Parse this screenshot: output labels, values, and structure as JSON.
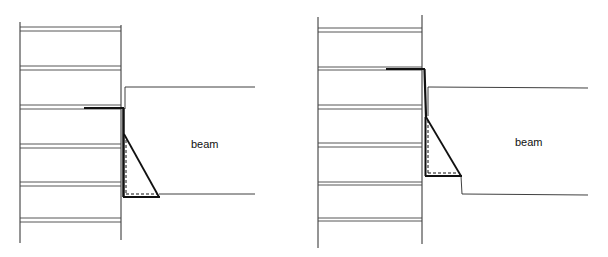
{
  "diagrams": [
    {
      "id": "left",
      "label": "beam",
      "description": "Column with seat angle below beam; angle top leg extends into column"
    },
    {
      "id": "right",
      "label": "beam",
      "description": "Column with raised seat angle; beam notched at bottom"
    }
  ],
  "colors": {
    "line": "#222222",
    "thick_line": "#111111",
    "background": "#ffffff"
  }
}
